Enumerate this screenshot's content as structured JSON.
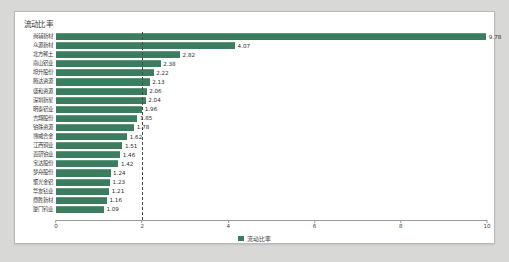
{
  "card": {
    "title": "流动比率"
  },
  "legend": {
    "position": "bottom-center",
    "swatch_color": "#3b7d5e",
    "label": "流动比率"
  },
  "style": {
    "bar_color": "#3b7d5e",
    "bar_top_highlight": "#5d9a7c",
    "page_background": "#d8d8d6",
    "card_background": "#ffffff",
    "card_border": "#b9b9b7",
    "axis_color": "#9a9a9a",
    "refline_color": "#4a4a4a",
    "text_color": "#3a3a3a"
  },
  "chart_data": {
    "type": "bar",
    "orientation": "horizontal",
    "title": "流动比率",
    "xlabel": "",
    "ylabel": "",
    "xlim": [
      0,
      10
    ],
    "xticks": [
      0,
      2,
      4,
      6,
      8,
      10
    ],
    "xtick_labels": [
      "0",
      "2",
      "4",
      "6",
      "8",
      "10"
    ],
    "grid": false,
    "reference_line": 2,
    "legend_entries": [
      "流动比率"
    ],
    "series_name": "流动比率",
    "categories": [
      "尚辅新材",
      "众源新材",
      "北方稀土",
      "南山铝业",
      "坦升股份",
      "腾达资源",
      "盛和资源",
      "深圳新星",
      "明泰铝业",
      "吉翔股份",
      "铂珠资源",
      "博威合金",
      "江西铜业",
      "贵研铂业",
      "宝达股份",
      "梦舟股份",
      "聚光金铝",
      "华友钴业",
      "鼎胜新材",
      "厦门钨业"
    ],
    "values": [
      9.78,
      4.07,
      2.82,
      2.38,
      2.22,
      2.13,
      2.06,
      2.04,
      1.96,
      1.85,
      1.78,
      1.62,
      1.51,
      1.46,
      1.42,
      1.24,
      1.23,
      1.21,
      1.16,
      1.09
    ]
  }
}
